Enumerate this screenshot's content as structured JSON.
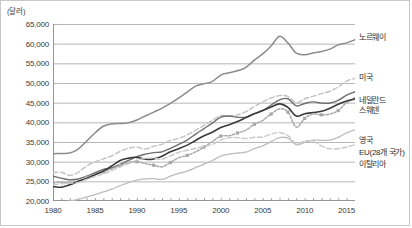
{
  "chart_data": {
    "type": "line",
    "title": "",
    "unit_label": "(달러)",
    "xlabel": "",
    "ylabel": "",
    "ylim": [
      20000,
      65000
    ],
    "ytick_labels": [
      "65,000",
      "60,000",
      "55,000",
      "50,000",
      "45,000",
      "40,000",
      "35,000",
      "30,000",
      "25,000",
      "20,000"
    ],
    "ytick_values": [
      65000,
      60000,
      55000,
      50000,
      45000,
      40000,
      35000,
      30000,
      25000,
      20000
    ],
    "xlim": [
      1980,
      2016
    ],
    "xtick_labels": [
      "1980",
      "1985",
      "1990",
      "1995",
      "2000",
      "2005",
      "2010",
      "2015"
    ],
    "xtick_values": [
      1980,
      1985,
      1990,
      1995,
      2000,
      2005,
      2010,
      2015
    ],
    "grid": true,
    "legend_position": "right",
    "x": [
      1980,
      1981,
      1982,
      1983,
      1984,
      1985,
      1986,
      1987,
      1988,
      1989,
      1990,
      1991,
      1992,
      1993,
      1994,
      1995,
      1996,
      1997,
      1998,
      1999,
      2000,
      2001,
      2002,
      2003,
      2004,
      2005,
      2006,
      2007,
      2008,
      2009,
      2010,
      2011,
      2012,
      2013,
      2014,
      2015,
      2016
    ],
    "series": [
      {
        "name": "노르웨이",
        "color": "#8c8c8c",
        "style": "solid",
        "width": 1.5,
        "marker": "none",
        "values": [
          32000,
          32100,
          32200,
          33200,
          35200,
          37300,
          39000,
          39600,
          39700,
          39900,
          40600,
          41600,
          42600,
          43600,
          44800,
          46200,
          47700,
          49200,
          49800,
          50400,
          52000,
          52600,
          53100,
          54000,
          55800,
          57400,
          59400,
          61900,
          60200,
          57600,
          57200,
          57600,
          58000,
          58600,
          59700,
          60200,
          61000
        ]
      },
      {
        "name": "미국",
        "color": "#c2c2c2",
        "style": "dashed",
        "width": 1.4,
        "marker": "none",
        "values": [
          27200,
          27300,
          26500,
          27300,
          28900,
          29900,
          30700,
          31500,
          32600,
          33400,
          33700,
          33200,
          33900,
          34400,
          35400,
          35900,
          36800,
          38000,
          39200,
          40500,
          41700,
          41600,
          41900,
          42700,
          44000,
          45200,
          46200,
          46800,
          46600,
          45000,
          46000,
          46600,
          47300,
          47900,
          49000,
          50500,
          51200
        ]
      },
      {
        "name": "네덜란드",
        "color": "#6e6e6e",
        "style": "solid",
        "width": 1.4,
        "marker": "none",
        "values": [
          26300,
          25800,
          25400,
          25600,
          26300,
          27200,
          28000,
          28400,
          29300,
          30300,
          31300,
          31900,
          32300,
          32500,
          33400,
          34400,
          35500,
          37000,
          38400,
          39800,
          41300,
          41600,
          41300,
          41300,
          42200,
          43000,
          44400,
          45700,
          46000,
          44200,
          44800,
          45200,
          44900,
          44900,
          45600,
          46900,
          47800
        ]
      },
      {
        "name": "스웨덴",
        "color": "#a8a8a8",
        "style": "dotted",
        "width": 1.5,
        "marker": "square",
        "values": [
          24600,
          24800,
          24600,
          25000,
          26000,
          26700,
          27400,
          28200,
          29000,
          29800,
          30000,
          29500,
          29100,
          28700,
          29800,
          31000,
          31600,
          32500,
          33700,
          35100,
          36500,
          36600,
          37300,
          38000,
          39500,
          40500,
          42100,
          43400,
          42600,
          38800,
          41000,
          42100,
          41900,
          42100,
          43000,
          45000,
          46000
        ]
      },
      {
        "name": "영국",
        "color": "#3a3a3a",
        "style": "solid",
        "width": 1.6,
        "marker": "none",
        "values": [
          23700,
          23500,
          24100,
          25000,
          25700,
          26700,
          27600,
          28900,
          30300,
          30900,
          31100,
          30600,
          30700,
          31400,
          32500,
          33300,
          34200,
          35400,
          36600,
          37500,
          38700,
          39400,
          40200,
          41200,
          42200,
          43000,
          43900,
          44700,
          43800,
          41600,
          42200,
          42500,
          42800,
          43600,
          44600,
          45400,
          46000
        ]
      },
      {
        "name": "EU(28개 국가)",
        "color": "#bdbdbd",
        "style": "solid",
        "width": 1.3,
        "marker": "none",
        "values": [
          19300,
          19600,
          20000,
          20400,
          21000,
          21600,
          22300,
          23000,
          23900,
          24700,
          25300,
          25600,
          25700,
          25500,
          26300,
          27000,
          27600,
          28500,
          29400,
          30300,
          31400,
          31900,
          32200,
          32400,
          33300,
          34000,
          35100,
          36100,
          36000,
          34300,
          34900,
          35500,
          35400,
          35500,
          36200,
          37300,
          38100
        ]
      },
      {
        "name": "이탈리아",
        "color": "#c9c9c9",
        "style": "dashed",
        "width": 1.4,
        "marker": "none",
        "values": [
          24100,
          24400,
          24500,
          24700,
          25500,
          26200,
          26900,
          27700,
          28700,
          29500,
          30400,
          30800,
          30900,
          30600,
          31500,
          32400,
          32900,
          33400,
          33900,
          34400,
          35500,
          36100,
          36100,
          35900,
          36200,
          36300,
          37000,
          37400,
          36600,
          34600,
          35200,
          35200,
          34000,
          33300,
          33300,
          33700,
          34300
        ]
      }
    ]
  },
  "legend": {
    "entries": [
      {
        "label": "노르웨이"
      },
      {
        "label": "미국"
      },
      {
        "label": "네덜란드"
      },
      {
        "label": "스웨덴"
      },
      {
        "label": "영국"
      },
      {
        "label": "EU(28개 국가)"
      },
      {
        "label": "이탈리아"
      }
    ]
  }
}
